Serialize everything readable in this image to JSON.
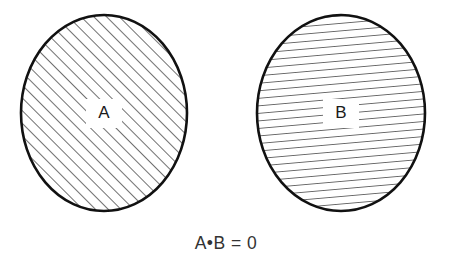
{
  "figure": {
    "type": "venn-diagram",
    "background_color": "#ffffff",
    "stroke_color": "#111111",
    "text_color": "#333333",
    "caption": "A•B = 0",
    "caption_plain": "A-B = 0",
    "sets": [
      {
        "id": "set-a",
        "label": "A",
        "fill_pattern": "diagonal-hatch",
        "hatch_angle_deg": 45,
        "hatch_spacing_px": 9,
        "center_x": 104,
        "center_y": 113,
        "radius_x": 83,
        "radius_y": 98
      },
      {
        "id": "set-b",
        "label": "B",
        "fill_pattern": "horizontal-hatch",
        "hatch_angle_deg": 5,
        "hatch_spacing_px": 7.5,
        "center_x": 341,
        "center_y": 113,
        "radius_x": 84,
        "radius_y": 98
      }
    ]
  }
}
